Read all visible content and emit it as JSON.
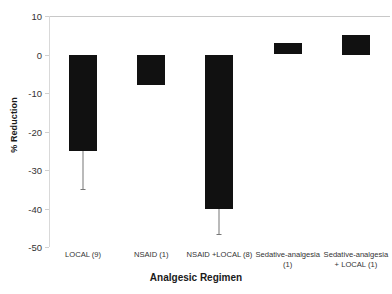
{
  "chart_data": {
    "type": "bar",
    "title": "",
    "xlabel": "Analgesic Regimen",
    "ylabel": "% Reduction",
    "categories": [
      "LOCAL (9)",
      "NSAID (1)",
      "NSAID +LOCAL (8)",
      "Sedative-analgesia (1)",
      "Sedative-analgesia + LOCAL (1)"
    ],
    "values": [
      -25,
      -8,
      -40,
      3,
      5
    ],
    "error_low": [
      -35,
      null,
      -46.5,
      null,
      null
    ],
    "ylim": [
      -50,
      10
    ],
    "yticks": [
      10,
      0,
      -10,
      -20,
      -30,
      -40,
      -50
    ],
    "ytick_labels": [
      "10",
      "0",
      "-10",
      "-20",
      "-30",
      "-40",
      "-50"
    ],
    "grid": false,
    "legend": "none",
    "bar_color": "#111111",
    "error_color": "#777777"
  },
  "axis": {
    "y_title": "% Reduction",
    "x_title": "Analgesic Regimen"
  }
}
